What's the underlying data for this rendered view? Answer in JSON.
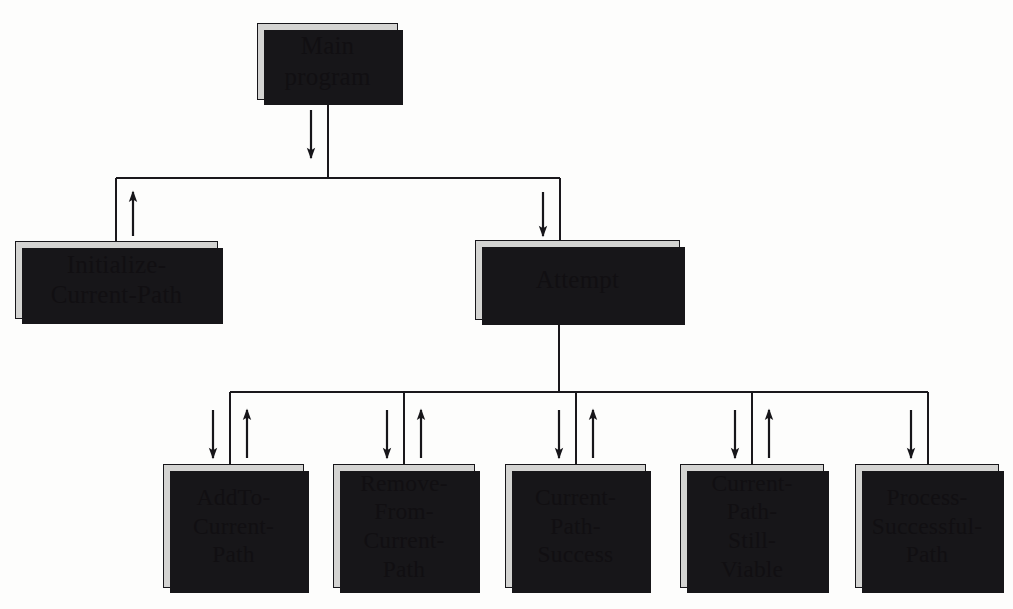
{
  "diagram": {
    "type": "structure-chart",
    "colors": {
      "box_fill": "#d4d4d2",
      "box_border": "#17161a",
      "shadow": "#171619",
      "line": "#1a181c",
      "background": "#fdfdfc"
    },
    "nodes": [
      {
        "id": "main-program",
        "label": "Main\nprogram",
        "level": 0,
        "x": 257,
        "y": 23,
        "w": 141,
        "h": 77
      },
      {
        "id": "initialize-current-path",
        "label": "Initialize-\nCurrent-Path",
        "level": 1,
        "x": 15,
        "y": 241,
        "w": 203,
        "h": 78
      },
      {
        "id": "attempt",
        "label": "Attempt",
        "level": 1,
        "x": 475,
        "y": 240,
        "w": 205,
        "h": 80
      },
      {
        "id": "add-to-current-path",
        "label": "AddTo-\nCurrent-\nPath",
        "level": 2,
        "x": 163,
        "y": 464,
        "w": 141,
        "h": 124
      },
      {
        "id": "remove-from-current-path",
        "label": "Remove-\nFrom-\nCurrent-\nPath",
        "level": 2,
        "x": 333,
        "y": 464,
        "w": 142,
        "h": 124
      },
      {
        "id": "current-path-success",
        "label": "Current-\nPath-\nSuccess",
        "level": 2,
        "x": 505,
        "y": 464,
        "w": 141,
        "h": 124
      },
      {
        "id": "current-path-still-viable",
        "label": "Current-\nPath-\nStill-\nViable",
        "level": 2,
        "x": 680,
        "y": 464,
        "w": 144,
        "h": 124
      },
      {
        "id": "process-successful-path",
        "label": "Process-\nSuccessful-\nPath",
        "level": 2,
        "x": 855,
        "y": 464,
        "w": 144,
        "h": 124
      }
    ],
    "connections": [
      {
        "from": "main-program",
        "to": "bus-top",
        "kind": "vertical-trunk",
        "direction": "down"
      },
      {
        "from": "bus-top",
        "to": "initialize-current-path",
        "kind": "branch",
        "direction": "up"
      },
      {
        "from": "bus-top",
        "to": "attempt",
        "kind": "branch",
        "direction": "down"
      },
      {
        "from": "attempt",
        "to": "bus-bottom",
        "kind": "vertical-trunk",
        "direction": "down"
      },
      {
        "from": "bus-bottom",
        "to": "add-to-current-path",
        "kind": "branch",
        "direction": "both"
      },
      {
        "from": "bus-bottom",
        "to": "remove-from-current-path",
        "kind": "branch",
        "direction": "both"
      },
      {
        "from": "bus-bottom",
        "to": "current-path-success",
        "kind": "branch",
        "direction": "both"
      },
      {
        "from": "bus-bottom",
        "to": "current-path-still-viable",
        "kind": "branch",
        "direction": "both"
      },
      {
        "from": "bus-bottom",
        "to": "process-successful-path",
        "kind": "branch",
        "direction": "down"
      }
    ],
    "buses": [
      {
        "id": "bus-top",
        "y": 178,
        "x1": 116,
        "x2": 560,
        "trunk_x": 328,
        "trunk_from_y": 100
      },
      {
        "id": "bus-bottom",
        "y": 392,
        "x1": 230,
        "x2": 928,
        "trunk_x": 559,
        "trunk_from_y": 320
      }
    ]
  }
}
